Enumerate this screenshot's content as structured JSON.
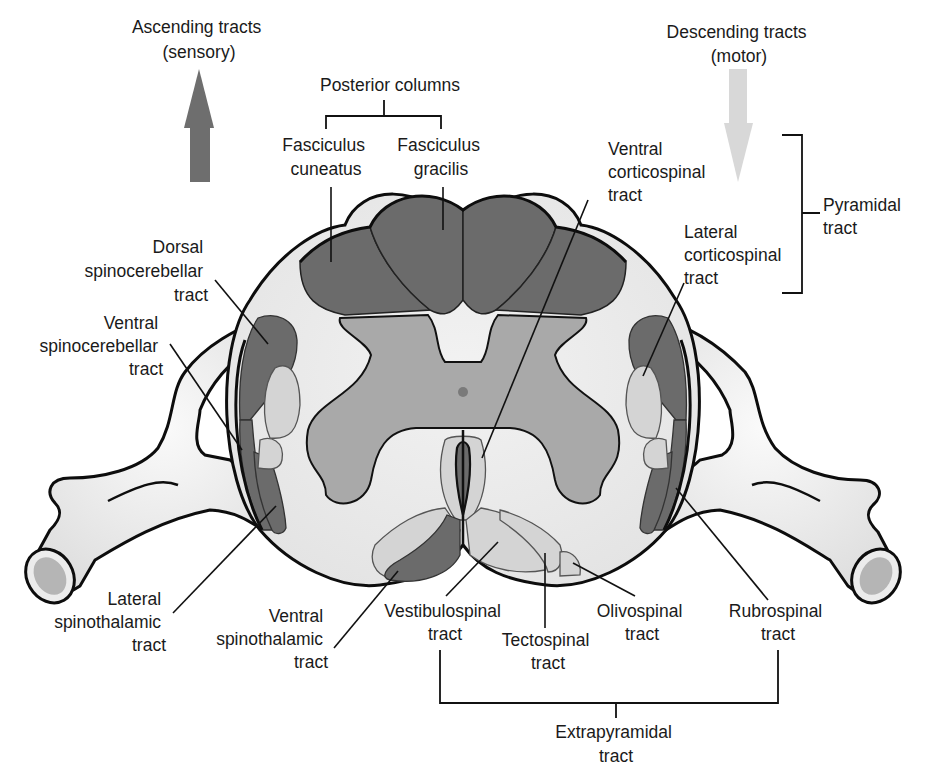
{
  "figure": {
    "colors": {
      "ascending_dark": "#6b6b6b",
      "descending_light": "#d4d4d4",
      "gray_matter": "#a9a9a9",
      "white_matter": "#ebebeb",
      "arrow_up": "#6e6e6e",
      "arrow_down": "#d6d6d6"
    }
  },
  "headers": {
    "ascending": {
      "line1": "Ascending tracts",
      "line2": "(sensory)",
      "arrow": "up-arrow"
    },
    "descending": {
      "line1": "Descending tracts",
      "line2": "(motor)",
      "arrow": "down-arrow"
    }
  },
  "groups": {
    "posterior_columns": "Posterior columns",
    "pyramidal": {
      "line1": "Pyramidal",
      "line2": "tract"
    },
    "extrapyramidal": {
      "line1": "Extrapyramidal",
      "line2": "tract"
    }
  },
  "labels": {
    "fasciculus_cuneatus": {
      "line1": "Fasciculus",
      "line2": "cuneatus"
    },
    "fasciculus_gracilis": {
      "line1": "Fasciculus",
      "line2": "gracilis"
    },
    "ventral_corticospinal": {
      "line1": "Ventral",
      "line2": "corticospinal",
      "line3": "tract"
    },
    "lateral_corticospinal": {
      "line1": "Lateral",
      "line2": "corticospinal",
      "line3": "tract"
    },
    "dorsal_spinocerebellar": {
      "line1": "Dorsal",
      "line2": "spinocerebellar",
      "line3": "tract"
    },
    "ventral_spinocerebellar": {
      "line1": "Ventral",
      "line2": "spinocerebellar",
      "line3": "tract"
    },
    "lateral_spinothalamic": {
      "line1": "Lateral",
      "line2": "spinothalamic",
      "line3": "tract"
    },
    "ventral_spinothalamic": {
      "line1": "Ventral",
      "line2": "spinothalamic",
      "line3": "tract"
    },
    "vestibulospinal": {
      "line1": "Vestibulospinal",
      "line2": "tract"
    },
    "tectospinal": {
      "line1": "Tectospinal",
      "line2": "tract"
    },
    "olivospinal": {
      "line1": "Olivospinal",
      "line2": "tract"
    },
    "rubrospinal": {
      "line1": "Rubrospinal",
      "line2": "tract"
    }
  }
}
